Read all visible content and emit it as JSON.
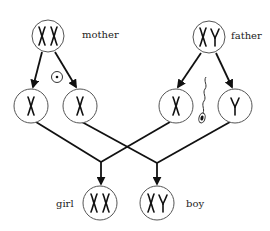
{
  "diagram": {
    "type": "sex-chromosome-inheritance",
    "nodes": {
      "mother": {
        "label": "mother",
        "chromosomes": "XX"
      },
      "father": {
        "label": "father",
        "chromosomes": "XY"
      },
      "mother_gamete_1": {
        "chromosomes": "X"
      },
      "mother_gamete_2": {
        "chromosomes": "X"
      },
      "father_gamete_1": {
        "chromosomes": "X"
      },
      "father_gamete_2": {
        "chromosomes": "Y"
      },
      "girl": {
        "label": "girl",
        "chromosomes": "XX"
      },
      "boy": {
        "label": "boy",
        "chromosomes": "XY"
      }
    },
    "symbols": {
      "egg": "egg-cell-icon",
      "sperm": "sperm-cell-icon"
    },
    "edges": [
      [
        "mother",
        "mother_gamete_1"
      ],
      [
        "mother",
        "mother_gamete_2"
      ],
      [
        "father",
        "father_gamete_1"
      ],
      [
        "father",
        "father_gamete_2"
      ],
      [
        "mother_gamete_1",
        "girl"
      ],
      [
        "father_gamete_1",
        "girl"
      ],
      [
        "mother_gamete_2",
        "boy"
      ],
      [
        "father_gamete_2",
        "boy"
      ]
    ]
  }
}
